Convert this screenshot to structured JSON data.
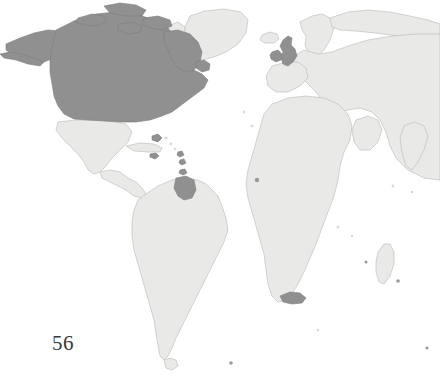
{
  "page": {
    "number": "56",
    "background_color": "#ffffff"
  },
  "figure": {
    "name": "world-map",
    "colors": {
      "ocean": "#ffffff",
      "land_plain_fill": "#e9e9e7",
      "land_plain_stroke": "#b9b9b7",
      "land_highlight_fill": "#909090",
      "land_highlight_stroke": "#7e7e7e"
    },
    "highlighted_regions": [
      "alaska-and-aleutians",
      "canada",
      "canadian-arctic-archipelago",
      "newfoundland",
      "united-states",
      "british-isles",
      "caribbean-islands",
      "british-guiana",
      "cape-colony-southern-africa"
    ],
    "plain_regions": [
      "greenland",
      "mexico",
      "central-america",
      "south-america",
      "europe",
      "scandinavia",
      "africa",
      "madagascar",
      "arabia",
      "asia",
      "iceland"
    ],
    "cropping": "map extends beyond right edge of page"
  }
}
